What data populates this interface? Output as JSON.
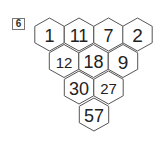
{
  "problem": {
    "number": "6"
  },
  "colors": {
    "stroke": "#555555",
    "text": "#222222",
    "fill": "#ffffff"
  },
  "geometry": {
    "hex_half_width": 14.7,
    "hex_half_height": 16.5
  },
  "pyramid": {
    "rows": [
      {
        "y": 34.5,
        "cells": [
          {
            "x": 49.5,
            "value": "1",
            "size": 18
          },
          {
            "x": 79,
            "value": "11",
            "size": 18
          },
          {
            "x": 108.5,
            "value": "7",
            "size": 18
          },
          {
            "x": 137.5,
            "value": "2",
            "size": 19
          }
        ]
      },
      {
        "y": 61,
        "cells": [
          {
            "x": 64,
            "value": "12",
            "size": 15
          },
          {
            "x": 93.5,
            "value": "18",
            "size": 18
          },
          {
            "x": 123,
            "value": "9",
            "size": 19
          }
        ]
      },
      {
        "y": 87.5,
        "cells": [
          {
            "x": 79,
            "value": "30",
            "size": 18
          },
          {
            "x": 108.5,
            "value": "27",
            "size": 15
          }
        ]
      },
      {
        "y": 114.5,
        "cells": [
          {
            "x": 94,
            "value": "57",
            "size": 18
          }
        ]
      }
    ]
  }
}
